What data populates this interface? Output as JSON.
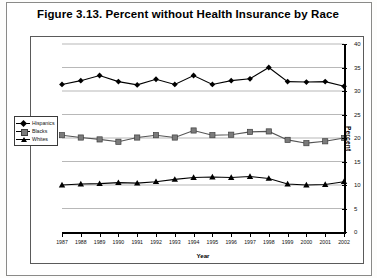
{
  "figure": {
    "title": "Figure 3.13.  Percent without Health Insurance by Race"
  },
  "legend": {
    "position": "left-middle",
    "items": [
      {
        "label": "Hispanics",
        "marker": "diamond-marker",
        "color": "#000000"
      },
      {
        "label": "Blacks",
        "marker": "square-marker",
        "color": "#7b7b7b"
      },
      {
        "label": "Whites",
        "marker": "triangle-marker",
        "color": "#000000"
      }
    ]
  },
  "axes": {
    "y_title": "Percent",
    "x_title": "Year",
    "y_ticks": [
      "0",
      "5",
      "10",
      "15",
      "20",
      "25",
      "30",
      "35",
      "40"
    ]
  },
  "chart_data": {
    "type": "line",
    "title": "Figure 3.13.  Percent without Health Insurance by Race",
    "xlabel": "Year",
    "ylabel": "Percent",
    "xlim": [
      1987,
      2002
    ],
    "ylim": [
      0,
      40
    ],
    "grid": true,
    "legend_position": "left-middle",
    "categories": [
      "1987",
      "1988",
      "1989",
      "1990",
      "1991",
      "1992",
      "1993",
      "1994",
      "1995",
      "1996",
      "1997",
      "1998",
      "1999",
      "2000",
      "2001",
      "2002"
    ],
    "series": [
      {
        "name": "Hispanics",
        "marker": "diamond",
        "values": [
          31.4,
          32.2,
          33.3,
          32.0,
          31.3,
          32.5,
          31.4,
          33.3,
          31.4,
          32.2,
          32.6,
          35.0,
          32.0,
          31.9,
          32.0,
          31.0
        ]
      },
      {
        "name": "Blacks",
        "marker": "square",
        "values": [
          20.6,
          20.1,
          19.7,
          19.2,
          20.1,
          20.6,
          20.1,
          21.6,
          20.6,
          20.7,
          21.3,
          21.4,
          19.6,
          18.9,
          19.3,
          20.0
        ]
      },
      {
        "name": "Whites",
        "marker": "triangle",
        "values": [
          10.0,
          10.2,
          10.3,
          10.5,
          10.4,
          10.7,
          11.2,
          11.6,
          11.7,
          11.6,
          11.8,
          11.4,
          10.2,
          10.0,
          10.1,
          10.7
        ]
      }
    ]
  }
}
